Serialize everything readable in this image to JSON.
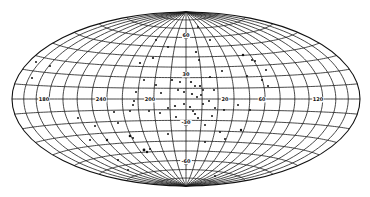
{
  "figure": {
    "projection": "hammer-aitoff",
    "center": {
      "x": 186,
      "y": 99
    },
    "semi_axes": {
      "a": 174,
      "b": 87
    },
    "meridian_step_deg": 15,
    "parallel_step_deg": 10,
    "colors": {
      "ink": "#111111",
      "background": "#ffffff"
    }
  },
  "labels": {
    "longitude": [
      {
        "text": "180",
        "x": 44,
        "y": 101
      },
      {
        "text": "240",
        "x": 101,
        "y": 101
      },
      {
        "text": "200",
        "x": 150,
        "y": 101
      },
      {
        "text": "20",
        "x": 225,
        "y": 101
      },
      {
        "text": "60",
        "x": 262,
        "y": 101
      },
      {
        "text": "120",
        "x": 318,
        "y": 101
      }
    ],
    "latitude": [
      {
        "text": "60",
        "x": 186,
        "y": 37
      },
      {
        "text": "30",
        "x": 186,
        "y": 76
      },
      {
        "text": "-30",
        "x": 186,
        "y": 124
      },
      {
        "text": "-60",
        "x": 186,
        "y": 163
      }
    ]
  },
  "points": [
    [
      186,
      37,
      2.2
    ],
    [
      186,
      76,
      2.2
    ],
    [
      186,
      124,
      2.2
    ],
    [
      186,
      163,
      2.2
    ],
    [
      262,
      100,
      1.8
    ],
    [
      320,
      100,
      1.8
    ],
    [
      140,
      63,
      1.1
    ],
    [
      153,
      58,
      1.1
    ],
    [
      196,
      52,
      1.1
    ],
    [
      199,
      60,
      1.0
    ],
    [
      210,
      77,
      1.0
    ],
    [
      222,
      71,
      1.0
    ],
    [
      243,
      55,
      1.2
    ],
    [
      255,
      61,
      1.0
    ],
    [
      247,
      76,
      1.0
    ],
    [
      262,
      80,
      1.0
    ],
    [
      268,
      86,
      1.0
    ],
    [
      172,
      80,
      1.1
    ],
    [
      180,
      82,
      1.0
    ],
    [
      191,
      82,
      1.1
    ],
    [
      195,
      86,
      1.0
    ],
    [
      200,
      86,
      1.1
    ],
    [
      203,
      90,
      1.0
    ],
    [
      178,
      90,
      1.0
    ],
    [
      184,
      92,
      1.0
    ],
    [
      192,
      94,
      1.1
    ],
    [
      197,
      97,
      1.0
    ],
    [
      201,
      95,
      1.0
    ],
    [
      161,
      93,
      1.0
    ],
    [
      156,
      85,
      1.0
    ],
    [
      144,
      80,
      1.0
    ],
    [
      136,
      92,
      1.0
    ],
    [
      133,
      105,
      1.0
    ],
    [
      149,
      111,
      1.0
    ],
    [
      160,
      113,
      1.0
    ],
    [
      168,
      108,
      1.0
    ],
    [
      175,
      106,
      1.1
    ],
    [
      184,
      104,
      1.0
    ],
    [
      190,
      107,
      1.1
    ],
    [
      193,
      111,
      1.0
    ],
    [
      195,
      114,
      1.1
    ],
    [
      198,
      118,
      1.0
    ],
    [
      203,
      104,
      1.0
    ],
    [
      209,
      101,
      1.0
    ],
    [
      215,
      108,
      1.0
    ],
    [
      224,
      110,
      1.0
    ],
    [
      238,
      105,
      1.0
    ],
    [
      176,
      117,
      1.0
    ],
    [
      188,
      121,
      1.0
    ],
    [
      205,
      125,
      1.0
    ],
    [
      212,
      116,
      1.0
    ],
    [
      214,
      90,
      1.0
    ],
    [
      250,
      110,
      1.0
    ],
    [
      114,
      112,
      1.0
    ],
    [
      130,
      111,
      1.0
    ],
    [
      134,
      101,
      1.0
    ],
    [
      118,
      123,
      1.0
    ],
    [
      95,
      126,
      1.0
    ],
    [
      78,
      118,
      1.0
    ],
    [
      130,
      136,
      1.3
    ],
    [
      133,
      138,
      1.0
    ],
    [
      144,
      150,
      1.4
    ],
    [
      147,
      152,
      1.2
    ],
    [
      150,
      149,
      1.0
    ],
    [
      107,
      140,
      1.2
    ],
    [
      90,
      140,
      1.0
    ],
    [
      168,
      134,
      1.0
    ],
    [
      220,
      132,
      1.0
    ],
    [
      241,
      130,
      1.2
    ],
    [
      225,
      139,
      1.0
    ],
    [
      205,
      142,
      1.0
    ],
    [
      118,
      160,
      1.0
    ],
    [
      36,
      62,
      1.0
    ],
    [
      32,
      78,
      1.0
    ],
    [
      50,
      66,
      1.0
    ],
    [
      128,
      170,
      1.0
    ],
    [
      215,
      176,
      1.0
    ],
    [
      252,
      60,
      1.0
    ],
    [
      266,
      70,
      1.0
    ],
    [
      168,
      47,
      1.0
    ],
    [
      156,
      40,
      1.0
    ],
    [
      210,
      40,
      1.0
    ],
    [
      198,
      27,
      1.0
    ]
  ]
}
